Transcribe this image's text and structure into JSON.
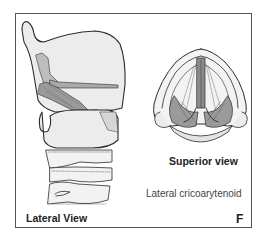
{
  "figure": {
    "panel_letter": "F",
    "muscle_label": "Lateral cricoarytenoid",
    "views": [
      {
        "id": "lateral",
        "label": "Lateral View"
      },
      {
        "id": "superior",
        "label": "Superior view"
      }
    ]
  },
  "colors": {
    "outline": "#2b2b2b",
    "cartilage_fill": "#ececec",
    "muscle_fill": "#9a9a9a",
    "muscle_dark": "#6a6a6a",
    "frame": "#555555"
  }
}
